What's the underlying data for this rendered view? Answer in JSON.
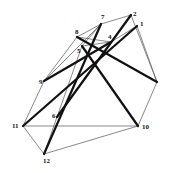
{
  "diagram": {
    "type": "graph",
    "vertices": [
      {
        "id": "1",
        "label": "1",
        "x": 137,
        "y": 26,
        "lx": 140,
        "ly": 26
      },
      {
        "id": "2",
        "label": "2",
        "x": 131,
        "y": 15,
        "lx": 133,
        "ly": 16
      },
      {
        "id": "3",
        "label": "",
        "x": 157,
        "y": 82,
        "lx": 160,
        "ly": 82
      },
      {
        "id": "4",
        "label": "4",
        "x": 111,
        "y": 42,
        "lx": 108,
        "ly": 39
      },
      {
        "id": "5",
        "label": "5",
        "x": 82,
        "y": 46,
        "lx": 77,
        "ly": 53
      },
      {
        "id": "6",
        "label": "6",
        "x": 57,
        "y": 117,
        "lx": 52,
        "ly": 118
      },
      {
        "id": "7",
        "label": "7",
        "x": 101,
        "y": 24,
        "lx": 101,
        "ly": 19
      },
      {
        "id": "8",
        "label": "8",
        "x": 77,
        "y": 37,
        "lx": 75,
        "ly": 34
      },
      {
        "id": "9",
        "label": "9",
        "x": 44,
        "y": 81,
        "lx": 39,
        "ly": 84
      },
      {
        "id": "10",
        "label": "10",
        "x": 138,
        "y": 126,
        "lx": 142,
        "ly": 129
      },
      {
        "id": "11",
        "label": "11",
        "x": 23,
        "y": 126,
        "lx": 12,
        "ly": 128
      },
      {
        "id": "12",
        "label": "12",
        "x": 44,
        "y": 154,
        "lx": 43,
        "ly": 163
      }
    ],
    "thin_edges": [
      [
        "7",
        "2"
      ],
      [
        "2",
        "3"
      ],
      [
        "1",
        "3"
      ],
      [
        "3",
        "10"
      ],
      [
        "10",
        "12"
      ],
      [
        "12",
        "11"
      ],
      [
        "11",
        "9"
      ],
      [
        "9",
        "8"
      ],
      [
        "9",
        "7"
      ],
      [
        "8",
        "7"
      ],
      [
        "8",
        "4"
      ],
      [
        "5",
        "4"
      ],
      [
        "5",
        "12"
      ],
      [
        "5",
        "7"
      ],
      [
        "4",
        "1"
      ],
      [
        "11",
        "10"
      ]
    ],
    "thick_edges": [
      [
        "8",
        "3"
      ],
      [
        "5",
        "10"
      ],
      [
        "9",
        "4"
      ],
      [
        "11",
        "1"
      ],
      [
        "6",
        "2"
      ],
      [
        "12",
        "7"
      ]
    ],
    "colors": {
      "thin": "#555555",
      "thick": "#111111",
      "background": "#ffffff"
    }
  }
}
